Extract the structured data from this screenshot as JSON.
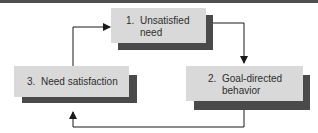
{
  "diagram": {
    "type": "cycle",
    "colors": {
      "box_face": "#d9d9d9",
      "box_shadow": "#4a4a4a",
      "text": "#2e2e2e",
      "arrow": "#1a1a1a",
      "top_rule": "#4f4f4f"
    },
    "nodes": [
      {
        "id": 1,
        "number": "1.",
        "line1": "Unsatisfied",
        "line2": "need"
      },
      {
        "id": 2,
        "number": "2.",
        "line1": "Goal-directed",
        "line2": "behavior"
      },
      {
        "id": 3,
        "number": "3.",
        "line1": "Need satisfaction",
        "line2": ""
      }
    ],
    "edges": [
      {
        "from": 1,
        "to": 2
      },
      {
        "from": 2,
        "to": 3
      },
      {
        "from": 3,
        "to": 1
      }
    ]
  }
}
